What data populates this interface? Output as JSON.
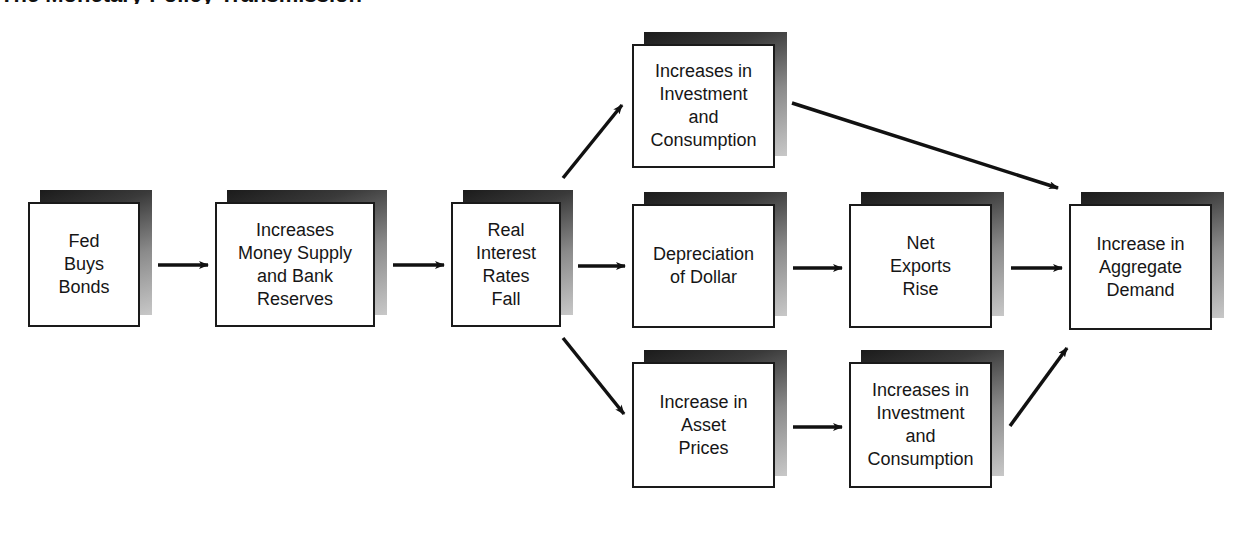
{
  "title_fragment": "The Monetary Policy Transmission Mechanism",
  "nodes": {
    "fed": {
      "label": "Fed\nBuys\nBonds"
    },
    "money": {
      "label": "Increases\nMoney Supply\nand Bank\nReserves"
    },
    "rates": {
      "label": "Real\nInterest\nRates\nFall"
    },
    "inv_top": {
      "label": "Increases in\nInvestment\nand\nConsumption"
    },
    "dollar": {
      "label": "Depreciation\nof Dollar"
    },
    "exports": {
      "label": "Net\nExports\nRise"
    },
    "demand": {
      "label": "Increase in\nAggregate\nDemand"
    },
    "assets": {
      "label": "Increase in\nAsset\nPrices"
    },
    "inv_bottom": {
      "label": "Increases in\nInvestment\nand\nConsumption"
    }
  },
  "edges": [
    {
      "from": "fed",
      "to": "money"
    },
    {
      "from": "money",
      "to": "rates"
    },
    {
      "from": "rates",
      "to": "inv_top"
    },
    {
      "from": "rates",
      "to": "dollar"
    },
    {
      "from": "rates",
      "to": "assets"
    },
    {
      "from": "inv_top",
      "to": "demand"
    },
    {
      "from": "dollar",
      "to": "exports"
    },
    {
      "from": "exports",
      "to": "demand"
    },
    {
      "from": "assets",
      "to": "inv_bottom"
    },
    {
      "from": "inv_bottom",
      "to": "demand"
    }
  ],
  "colors": {
    "line": "#111111",
    "box_border": "#1a1a1a",
    "shadow_dark": "#1b1b1b",
    "shadow_light": "#c8c8c8"
  }
}
